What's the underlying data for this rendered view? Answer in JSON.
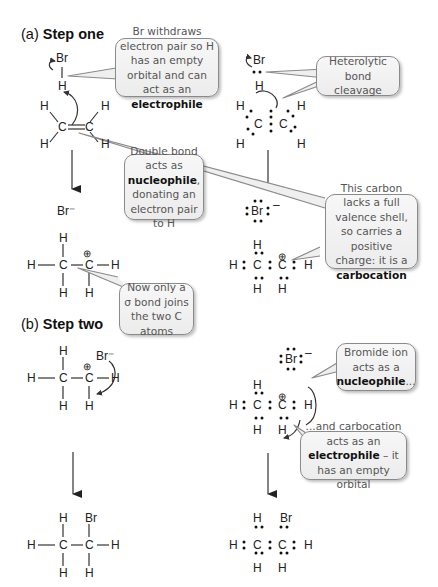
{
  "sections": {
    "step_one": {
      "label_prefix": "(a)",
      "label_bold": "Step one"
    },
    "step_two": {
      "label_prefix": "(b)",
      "label_bold": "Step two"
    }
  },
  "callouts": {
    "electrophile_hbr": {
      "pre": "Br withdraws electron pair so H has an empty orbital and can act as an",
      "bold": "electrophile",
      "post": ""
    },
    "heterolytic": {
      "pre": "Heterolytic bond cleavage",
      "bold": "",
      "post": ""
    },
    "double_bond": {
      "pre": "Double bond acts as",
      "bold": "nucleophile",
      "post": ", donating an electron pair to H"
    },
    "carbocation": {
      "pre": "This carbon lacks a full valence shell, so carries a positive charge: it is a",
      "bold": "carbocation",
      "post": ""
    },
    "sigma_bond": {
      "pre": "Now only a σ bond joins the two C atoms",
      "bold": "",
      "post": ""
    },
    "bromide_nucleophile": {
      "pre": "Bromide ion acts as a",
      "bold": "nucleophile",
      "post": "..."
    },
    "carbocation_electrophile": {
      "pre": "...and carbocation acts as an",
      "bold": "electrophile",
      "post": " – it has an empty orbital"
    }
  },
  "atoms": {
    "H": "H",
    "C": "C",
    "Br": "Br",
    "Br_minus": "Br⁻",
    "plus": "⊕",
    "minus": "–"
  },
  "colors": {
    "callout_border": "#8a8a8a",
    "callout_fill": "#efefef",
    "callout_text": "#555555",
    "bond": "#333333"
  }
}
